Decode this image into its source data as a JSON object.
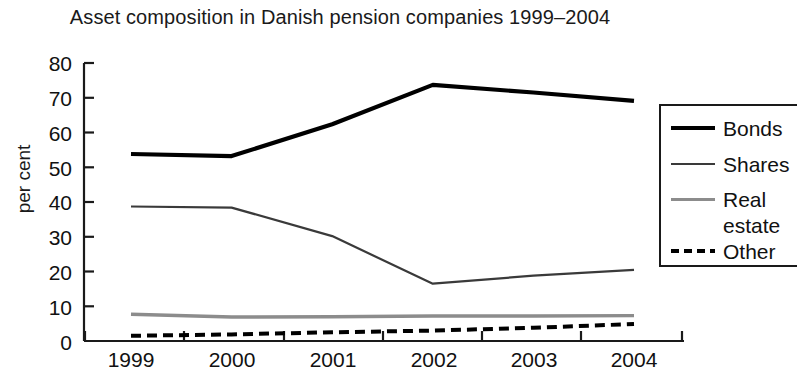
{
  "chart_data": {
    "type": "line",
    "title": "Asset composition in Danish pension companies 1999–2004",
    "xlabel": "",
    "ylabel": "per cent",
    "categories": [
      "1999",
      "2000",
      "2001",
      "2002",
      "2003",
      "2004"
    ],
    "x_tick_labels": [
      "1999",
      "2000",
      "2001",
      "2002",
      "2003",
      "2004"
    ],
    "y_tick_labels": [
      "0",
      "10",
      "20",
      "30",
      "40",
      "50",
      "60",
      "70",
      "80"
    ],
    "ylim": [
      0,
      80
    ],
    "y_ticks": [
      0,
      10,
      20,
      30,
      40,
      50,
      60,
      70,
      80
    ],
    "grid": false,
    "legend_position": "right",
    "series": [
      {
        "name": "Bonds",
        "style": "solid-thick",
        "color": "#000000",
        "values": [
          53.8,
          53.2,
          62.4,
          73.7,
          71.5,
          69.1
        ]
      },
      {
        "name": "Shares",
        "style": "solid-thin",
        "color": "#3a3a3a",
        "values": [
          38.7,
          38.4,
          30.2,
          16.5,
          18.8,
          20.5
        ]
      },
      {
        "name": "Real estate",
        "style": "solid-gray",
        "color": "#8c8c8c",
        "values": [
          7.7,
          6.9,
          7.0,
          7.2,
          7.2,
          7.3
        ]
      },
      {
        "name": "Other",
        "style": "dashed",
        "color": "#000000",
        "values": [
          1.5,
          1.9,
          2.5,
          3.0,
          3.8,
          4.9
        ]
      }
    ]
  },
  "legend": {
    "entries": [
      {
        "label": "Bonds",
        "label_cont": ""
      },
      {
        "label": "Shares",
        "label_cont": ""
      },
      {
        "label": "Real",
        "label_cont": "estate"
      },
      {
        "label": "Other",
        "label_cont": ""
      }
    ]
  }
}
